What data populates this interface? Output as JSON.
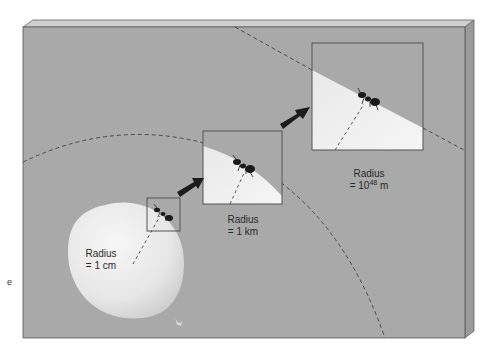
{
  "figure": {
    "labels": [
      {
        "id": "small",
        "line1": "Radius",
        "line2_prefix": "= 1 cm",
        "sup": "",
        "line2_suffix": ""
      },
      {
        "id": "medium",
        "line1": "Radius",
        "line2_prefix": "= 1 km",
        "sup": "",
        "line2_suffix": ""
      },
      {
        "id": "large",
        "line1": "Radius",
        "line2_prefix": "= 10",
        "sup": "48",
        "line2_suffix": " m"
      }
    ],
    "edge_fragment": "e",
    "colors": {
      "panel_front": "#a9a9a9",
      "panel_top": "#cfcfcf",
      "panel_side": "#9a9a9a",
      "balloon": "#ececec",
      "dash": "#4a4a4a",
      "arrow": "#1c1c1c",
      "ant": "#1a1a1a",
      "box_border": "#555555"
    }
  }
}
